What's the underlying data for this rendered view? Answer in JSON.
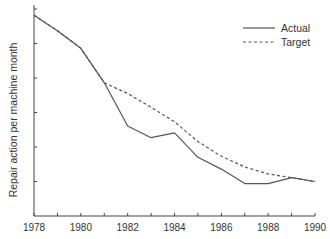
{
  "chart_data": {
    "type": "line",
    "title": "",
    "xlabel": "",
    "ylabel": "Repair action per machine month",
    "x": [
      1978,
      1979,
      1980,
      1981,
      1982,
      1983,
      1984,
      1985,
      1986,
      1987,
      1988,
      1989,
      1990
    ],
    "x_tick_labels": [
      "1978",
      "1980",
      "1982",
      "1984",
      "1986",
      "1988",
      "1990"
    ],
    "xlim": [
      1978,
      1990
    ],
    "ylim": [
      0,
      6
    ],
    "y_ticks_unlabeled": [
      1,
      2,
      3,
      4,
      5,
      6
    ],
    "grid": false,
    "legend_position": "upper right",
    "series": [
      {
        "name": "Actual",
        "style": "solid",
        "values": [
          5.82,
          5.37,
          4.86,
          3.86,
          2.61,
          2.27,
          2.41,
          1.7,
          1.36,
          0.94,
          0.94,
          1.11,
          1.0
        ]
      },
      {
        "name": "Target",
        "style": "dashed",
        "values": [
          5.82,
          5.37,
          4.86,
          3.86,
          3.55,
          3.15,
          2.73,
          2.16,
          1.73,
          1.42,
          1.22,
          1.11,
          1.0
        ]
      }
    ]
  },
  "colors": {
    "line": "#555555",
    "axis": "#444444",
    "text": "#333333"
  }
}
